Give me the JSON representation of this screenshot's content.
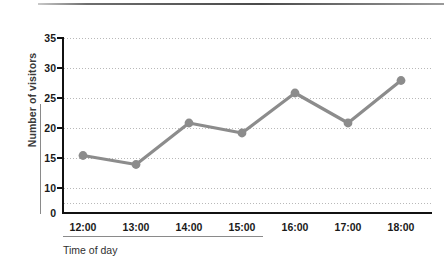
{
  "chart_data": {
    "type": "line",
    "title": "",
    "xlabel": "Time of day",
    "ylabel": "Number of visitors",
    "categories": [
      "12:00",
      "13:00",
      "14:00",
      "15:00",
      "16:00",
      "17:00",
      "18:00"
    ],
    "values": [
      11.5,
      9.7,
      18,
      16,
      24,
      18,
      26.5
    ],
    "series": [
      {
        "name": "Number of visitors",
        "values": [
          11.5,
          9.7,
          18,
          16,
          24,
          18,
          26.5
        ]
      }
    ],
    "ylim": [
      0,
      35
    ],
    "ytick_labels": [
      "35",
      "30",
      "25",
      "20",
      "15",
      "10",
      "0"
    ],
    "ytick_values": [
      35,
      30,
      25,
      20,
      15,
      10,
      0
    ],
    "gridline_values": [
      35,
      30,
      25,
      20,
      15,
      10,
      5
    ],
    "grid": true,
    "grid_style": "dotted",
    "legend": "none",
    "line_color": "#8c8c8c",
    "marker_color": "#8c8c8c",
    "marker_shape": "circle",
    "axis_color": "#111111",
    "grid_color": "#b9b9b9"
  },
  "axis": {
    "y_title": "Number of visitors",
    "x_title": "Time of day"
  }
}
